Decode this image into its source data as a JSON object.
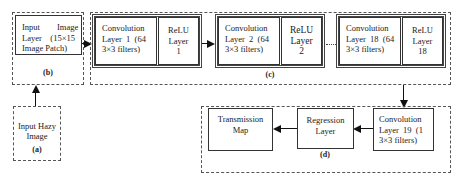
{
  "diagram": {
    "type": "flowchart",
    "title": "",
    "groups": {
      "a": {
        "label": "(a)",
        "nodes": [
          "input_hazy"
        ]
      },
      "b": {
        "label": "(b)",
        "nodes": [
          "input_layer"
        ]
      },
      "c": {
        "label": "(c)",
        "nodes": [
          "conv1",
          "relu1",
          "conv2",
          "relu2",
          "conv18",
          "relu18"
        ]
      },
      "d": {
        "label": "(d)",
        "nodes": [
          "conv19",
          "regression",
          "transmission"
        ]
      }
    },
    "nodes": {
      "input_hazy": {
        "line1": "Input Hazy",
        "line2": "Image"
      },
      "input_layer": {
        "line1": "Input        Image",
        "line2": "Layer    (15×15",
        "line3": "Image Patch)"
      },
      "conv1": {
        "line1": "Convolution",
        "line2": "Layer  1  (64",
        "line3": "3×3 filters)"
      },
      "relu1": {
        "line1": "ReLU",
        "line2": "Layer",
        "line3": "1"
      },
      "conv2": {
        "line1": "Convolution",
        "line2": "Layer  2  (64",
        "line3": "3×3 filters)"
      },
      "relu2": {
        "line1": "ReLU",
        "line2": "Layer",
        "line3": "2"
      },
      "conv18": {
        "line1": "Convolution",
        "line2": "Layer  18  (64",
        "line3": "3×3 filters)"
      },
      "relu18": {
        "line1": "ReLU",
        "line2": "Layer",
        "line3": "18"
      },
      "conv19": {
        "line1": "Convolution",
        "line2": "Layer  19  (1",
        "line3": "3×3 filters)"
      },
      "regression": {
        "line1": "Regression",
        "line2": "Layer"
      },
      "transmission": {
        "line1": "Transmission",
        "line2": "Map"
      }
    },
    "edges": [
      {
        "from": "input_hazy",
        "to": "input_layer"
      },
      {
        "from": "input_layer",
        "to": "conv1"
      },
      {
        "from": "relu1",
        "to": "conv2"
      },
      {
        "from": "relu2",
        "to": "conv18",
        "style": "dotted"
      },
      {
        "from": "relu18",
        "to": "conv19"
      },
      {
        "from": "conv19",
        "to": "regression"
      },
      {
        "from": "regression",
        "to": "transmission"
      }
    ]
  }
}
